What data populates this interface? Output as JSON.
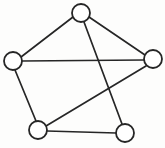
{
  "figure": {
    "type": "node-link-diagram",
    "width": 165,
    "height": 148,
    "background_color": "#fdfdfc",
    "line_color": "#262626",
    "node_fill_color": "#ffffff",
    "node_radius": 9,
    "stroke_width": 1.7
  },
  "graph": {
    "node_count": 5,
    "edge_count": 7,
    "nodes": [
      {
        "id": "top",
        "label": "",
        "cx": 81,
        "cy": 13,
        "r": 9,
        "degree": 3
      },
      {
        "id": "left",
        "label": "",
        "cx": 13,
        "cy": 61,
        "r": 9,
        "degree": 3
      },
      {
        "id": "right",
        "label": "",
        "cx": 153,
        "cy": 59,
        "r": 9,
        "degree": 3
      },
      {
        "id": "bottom-left",
        "label": "",
        "cx": 38,
        "cy": 130,
        "r": 9,
        "degree": 3
      },
      {
        "id": "bottom-right",
        "label": "",
        "cx": 125,
        "cy": 133,
        "r": 9,
        "degree": 2
      }
    ],
    "edges": [
      {
        "id": "edge-top-left",
        "from": "top",
        "to": "left",
        "x1": 73,
        "y1": 17,
        "x2": 21,
        "y2": 57
      },
      {
        "id": "edge-top-right",
        "from": "top",
        "to": "right",
        "x1": 89,
        "y1": 17,
        "x2": 145,
        "y2": 55
      },
      {
        "id": "edge-top-bottom-right",
        "from": "top",
        "to": "bottom-right",
        "x1": 84,
        "y1": 22,
        "x2": 122,
        "y2": 124
      },
      {
        "id": "edge-left-right",
        "from": "left",
        "to": "right",
        "x1": 22,
        "y1": 61,
        "x2": 144,
        "y2": 60
      },
      {
        "id": "edge-left-bottom-left",
        "from": "left",
        "to": "bottom-left",
        "x1": 15,
        "y1": 70,
        "x2": 36,
        "y2": 121
      },
      {
        "id": "edge-bottom-left-right",
        "from": "bottom-left",
        "to": "right",
        "x1": 46,
        "y1": 126,
        "x2": 146,
        "y2": 66
      },
      {
        "id": "edge-bottom-left-bottom-right",
        "from": "bottom-left",
        "to": "bottom-right",
        "x1": 47,
        "y1": 131,
        "x2": 116,
        "y2": 133
      }
    ]
  }
}
